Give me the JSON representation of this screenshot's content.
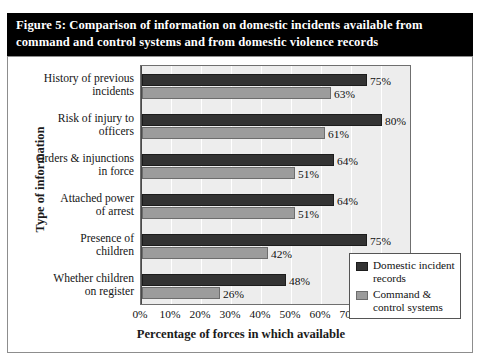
{
  "figure": {
    "title": "Figure 5: Comparison of information on domestic incidents available from command and control systems and from domestic violence records",
    "title_colors": {
      "background": "#000000",
      "text": "#ffffff"
    }
  },
  "chart_data": {
    "type": "bar",
    "orientation": "horizontal",
    "title": "Figure 5: Comparison of information on domestic incidents available from command and control systems and from domestic violence records",
    "xlabel": "Percentage of forces in which available",
    "ylabel": "Type of information",
    "categories": [
      "History of previous incidents",
      "Risk of injury to officers",
      "Orders & injunctions in force",
      "Attached power of arrest",
      "Presence of children",
      "Whether children on register"
    ],
    "category_lines": [
      [
        "History of previous",
        "incidents"
      ],
      [
        "Risk of injury to",
        "officers"
      ],
      [
        "Orders & injunctions",
        "in force"
      ],
      [
        "Attached power",
        "of arrest"
      ],
      [
        "Presence of",
        "children"
      ],
      [
        "Whether children",
        "on register"
      ]
    ],
    "series": [
      {
        "name": "Domestic incident records",
        "name_lines": [
          "Domestic incident",
          "records"
        ],
        "color": "#333333",
        "values": [
          75,
          80,
          64,
          64,
          75,
          48
        ],
        "labels": [
          "75%",
          "80%",
          "64%",
          "64%",
          "75%",
          "48%"
        ]
      },
      {
        "name": "Command & control systems",
        "name_lines": [
          "Command &",
          "control systems"
        ],
        "color": "#9c9c9c",
        "values": [
          63,
          61,
          51,
          51,
          42,
          26
        ],
        "labels": [
          "63%",
          "61%",
          "51%",
          "51%",
          "42%",
          "26%"
        ]
      }
    ],
    "xlim": [
      0,
      90
    ],
    "xticks": [
      0,
      10,
      20,
      30,
      40,
      50,
      60,
      70,
      80,
      90
    ],
    "xtick_labels": [
      "0%",
      "10%",
      "20%",
      "30%",
      "40%",
      "50%",
      "60%",
      "70%",
      "80%",
      "90%"
    ],
    "grid": "vertical",
    "legend_position": "bottom-right",
    "plot_background": "#ededed",
    "gridline_color": "#ffffff"
  }
}
